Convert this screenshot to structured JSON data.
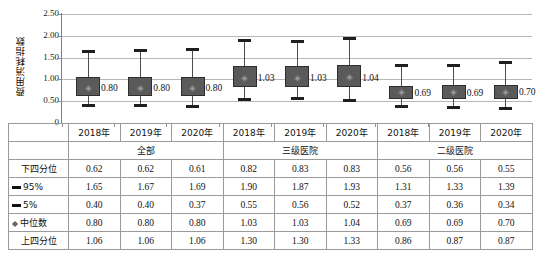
{
  "chart_data": {
    "type": "box",
    "title": "",
    "xlabel": "",
    "ylabel": "费用消耗指数",
    "ylim": [
      0,
      2.5
    ],
    "ytick_labels": [
      "0",
      "0.50",
      "1.00",
      "1.50",
      "2.00",
      "2.50"
    ],
    "ytick_values": [
      0,
      0.5,
      1.0,
      1.5,
      2.0,
      2.5
    ],
    "grid": true,
    "legend_position": "none",
    "groups": [
      {
        "name": "全部",
        "years": [
          "2018年",
          "2019年",
          "2020年"
        ]
      },
      {
        "name": "三级医院",
        "years": [
          "2018年",
          "2019年",
          "2020年"
        ]
      },
      {
        "name": "二级医院",
        "years": [
          "2018年",
          "2019年",
          "2020年"
        ]
      }
    ],
    "categories": [
      "2018年",
      "2019年",
      "2020年",
      "2018年",
      "2019年",
      "2020年",
      "2018年",
      "2019年",
      "2020年"
    ],
    "series": [
      {
        "name": "下四分位",
        "values": [
          0.62,
          0.62,
          0.61,
          0.82,
          0.83,
          0.83,
          0.56,
          0.56,
          0.55
        ]
      },
      {
        "name": "95%",
        "values": [
          1.65,
          1.67,
          1.69,
          1.9,
          1.87,
          1.93,
          1.31,
          1.33,
          1.39
        ]
      },
      {
        "name": "5%",
        "values": [
          0.4,
          0.4,
          0.37,
          0.55,
          0.56,
          0.52,
          0.37,
          0.36,
          0.34
        ]
      },
      {
        "name": "中位数",
        "values": [
          0.8,
          0.8,
          0.8,
          1.03,
          1.03,
          1.04,
          0.69,
          0.69,
          0.7
        ]
      },
      {
        "name": "上四分位",
        "values": [
          1.06,
          1.06,
          1.06,
          1.3,
          1.3,
          1.33,
          0.86,
          0.87,
          0.87
        ]
      }
    ],
    "median_labels": [
      "0.80",
      "0.80",
      "0.80",
      "1.03",
      "1.03",
      "1.04",
      "0.69",
      "0.69",
      "0.70"
    ],
    "colors": {
      "box_fill": "#5a5a5a",
      "box_border": "#2e2e2e",
      "whisker": "#4d4d4d",
      "cap": "#1f1f1f",
      "median_marker": "#9a9a9a",
      "gridline": "#b7b7b7",
      "axis": "#808080"
    }
  },
  "table": {
    "row_labels": [
      "下四分位",
      "95%",
      "5%",
      "中位数",
      "上四分位"
    ],
    "row_marker_types": [
      "none",
      "dash",
      "dash",
      "diamond",
      "none"
    ],
    "header_years": [
      "2018年",
      "2019年",
      "2020年",
      "2018年",
      "2019年",
      "2020年",
      "2018年",
      "2019年",
      "2020年"
    ],
    "group_headers": [
      "全部",
      "三级医院",
      "二级医院"
    ],
    "rows": [
      {
        "label": "下四分位",
        "values": [
          "0.62",
          "0.62",
          "0.61",
          "0.82",
          "0.83",
          "0.83",
          "0.56",
          "0.56",
          "0.55"
        ]
      },
      {
        "label": "95%",
        "values": [
          "1.65",
          "1.67",
          "1.69",
          "1.90",
          "1.87",
          "1.93",
          "1.31",
          "1.33",
          "1.39"
        ]
      },
      {
        "label": "5%",
        "values": [
          "0.40",
          "0.40",
          "0.37",
          "0.55",
          "0.56",
          "0.52",
          "0.37",
          "0.36",
          "0.34"
        ]
      },
      {
        "label": "中位数",
        "values": [
          "0.80",
          "0.80",
          "0.80",
          "1.03",
          "1.03",
          "1.04",
          "0.69",
          "0.69",
          "0.70"
        ]
      },
      {
        "label": "上四分位",
        "values": [
          "1.06",
          "1.06",
          "1.06",
          "1.30",
          "1.30",
          "1.33",
          "0.86",
          "0.87",
          "0.87"
        ]
      }
    ]
  }
}
